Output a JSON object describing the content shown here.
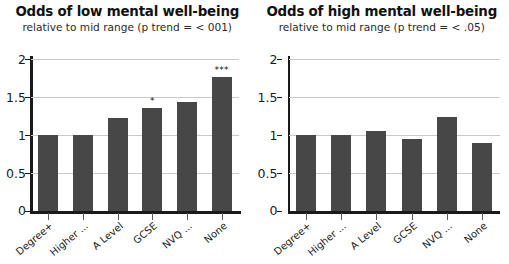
{
  "chart_data": [
    {
      "type": "bar",
      "title": "Odds of low mental well-being",
      "subtitle": "relative to mid range (p trend = < 001)",
      "xlabel": "",
      "ylabel": "",
      "ylim": [
        0,
        2
      ],
      "yticks": [
        "0",
        "0.5",
        "1",
        "1.5",
        "2"
      ],
      "grid": true,
      "legend": "none",
      "categories": [
        "Degree+",
        "Higher ...",
        "A Level",
        "GCSE",
        "NVQ ...",
        "None"
      ],
      "values": [
        1.0,
        1.0,
        1.22,
        1.36,
        1.43,
        1.76
      ],
      "annotations": [
        "",
        "",
        "",
        "*",
        "",
        "***"
      ]
    },
    {
      "type": "bar",
      "title": "Odds of high mental well-being",
      "subtitle": "relative to mid range (p trend = < .05)",
      "xlabel": "",
      "ylabel": "",
      "ylim": [
        0,
        2
      ],
      "yticks": [
        "0",
        "0.5",
        "1",
        "1.5",
        "2"
      ],
      "grid": true,
      "legend": "none",
      "categories": [
        "Degree+",
        "Higher ...",
        "A Level",
        "GCSE",
        "NVQ ...",
        "None"
      ],
      "values": [
        1.0,
        1.0,
        1.05,
        0.95,
        1.24,
        0.9
      ],
      "annotations": [
        "",
        "",
        "",
        "",
        "",
        ""
      ]
    }
  ],
  "style": {
    "bar_color": "#474747",
    "axis_color": "#1a1a1a",
    "grid_color": "#c9c9c9",
    "background": "#ffffff"
  }
}
